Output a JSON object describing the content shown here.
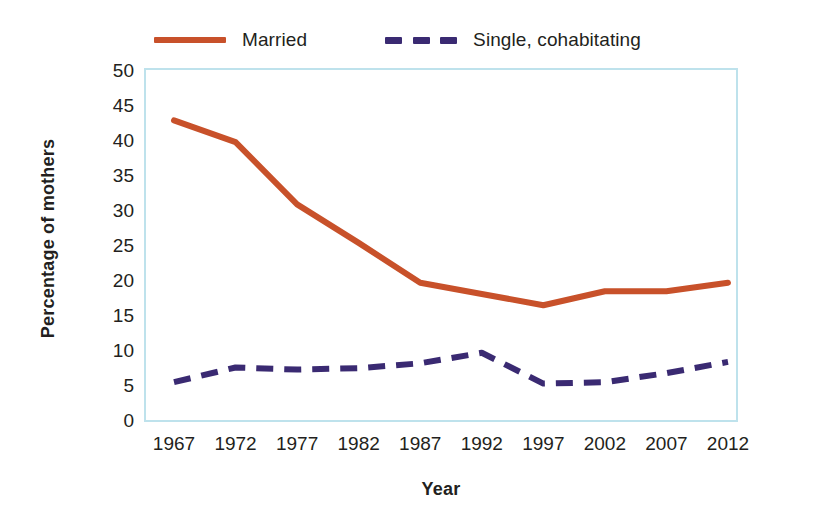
{
  "chart_data": {
    "type": "line",
    "title": "",
    "xlabel": "Year",
    "ylabel": "Percentage of mothers",
    "categories": [
      "1967",
      "1972",
      "1977",
      "1982",
      "1987",
      "1992",
      "1997",
      "2002",
      "2007",
      "2012"
    ],
    "x": [
      1967,
      1972,
      1977,
      1982,
      1987,
      1992,
      1997,
      2002,
      2007,
      2012
    ],
    "xlim": [
      1967,
      2012
    ],
    "ylim": [
      0,
      50
    ],
    "ytick_values": [
      0,
      5,
      10,
      15,
      20,
      25,
      30,
      35,
      40,
      45,
      50
    ],
    "ytick_labels": [
      "0",
      "5",
      "10",
      "15",
      "20",
      "25",
      "30",
      "35",
      "40",
      "45",
      "50"
    ],
    "grid": false,
    "legend_position": "top",
    "series": [
      {
        "name": "Married",
        "style": "solid",
        "color": "#C8512A",
        "values": [
          42.8,
          39.7,
          30.8,
          25.3,
          19.6,
          18.0,
          16.4,
          18.4,
          18.4,
          19.6
        ]
      },
      {
        "name": "Single, cohabitating",
        "style": "dashed",
        "color": "#3A2A72",
        "values": [
          5.4,
          7.5,
          7.2,
          7.4,
          8.1,
          9.6,
          5.2,
          5.4,
          6.7,
          8.3
        ]
      }
    ]
  },
  "legend": {
    "entries": [
      {
        "label": "Married"
      },
      {
        "label": "Single, cohabitating"
      }
    ]
  },
  "axes": {
    "y_title": "Percentage of mothers",
    "x_title": "Year"
  },
  "colors": {
    "married_line": "#C8512A",
    "single_line": "#3A2A72",
    "plot_border": "#BEE2EC",
    "text": "#231f20",
    "background": "#FFFFFF"
  }
}
